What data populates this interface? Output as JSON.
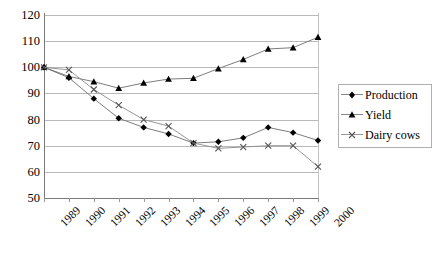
{
  "chart_data": {
    "type": "line",
    "title": "",
    "xlabel": "",
    "ylabel": "",
    "categories": [
      "1989",
      "1990",
      "1991",
      "1992",
      "1993",
      "1994",
      "1995",
      "1996",
      "1997",
      "1998",
      "1999",
      "2000"
    ],
    "ylim": [
      50,
      120
    ],
    "ytick_values": [
      50,
      60,
      70,
      80,
      90,
      100,
      110,
      120
    ],
    "ytick_labels": [
      "50",
      "60",
      "70",
      "80",
      "90",
      "100",
      "110",
      "120"
    ],
    "grid": true,
    "legend_position": "right",
    "series": [
      {
        "name": "Production",
        "marker": "diamond",
        "color": "#000000",
        "values": [
          100,
          96,
          88,
          80.5,
          77,
          74.5,
          71,
          71.5,
          73,
          77,
          75,
          72
        ]
      },
      {
        "name": "Yield",
        "marker": "triangle",
        "color": "#000000",
        "values": [
          100,
          96.5,
          94.5,
          92,
          94,
          95.5,
          95.8,
          99.5,
          103,
          107,
          107.5,
          111.5
        ]
      },
      {
        "name": "Dairy cows",
        "marker": "cross",
        "color": "#555555",
        "values": [
          100,
          99,
          91.5,
          85.5,
          80,
          77.5,
          71,
          69,
          69.5,
          70,
          70,
          62
        ]
      }
    ]
  },
  "legend": {
    "items": [
      {
        "label": "Production"
      },
      {
        "label": "Yield"
      },
      {
        "label": "Dairy cows"
      }
    ]
  }
}
